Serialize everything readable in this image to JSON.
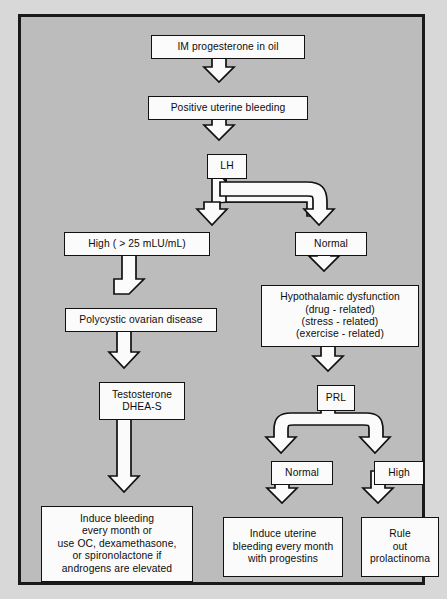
{
  "diagram": {
    "background_color": "#bcbcbc",
    "node_fill_color": "#fbfbfb",
    "line_color": "#111111",
    "frame_border_color": "#1a1a1a"
  },
  "nodes": {
    "im_progesterone": {
      "label": "IM progesterone in oil"
    },
    "positive_bleeding": {
      "label": "Positive uterine bleeding"
    },
    "lh": {
      "label": "LH"
    },
    "high_lh": {
      "label": "High ( > 25 mLU/mL)"
    },
    "normal_lh": {
      "label": "Normal"
    },
    "polycystic": {
      "label": "Polycystic ovarian disease"
    },
    "hypothalamic": {
      "line1": "Hypothalamic dysfunction",
      "line2": "(drug - related)",
      "line3": "(stress - related)",
      "line4": "(exercise - related)"
    },
    "testosterone": {
      "line1": "Testosterone",
      "line2": "DHEA-S"
    },
    "prl": {
      "label": "PRL"
    },
    "normal_prl": {
      "label": "Normal"
    },
    "high_prl": {
      "label": "High"
    },
    "induce_bleeding": {
      "line1": "Induce bleeding",
      "line2": "every month or",
      "line3": "use OC, dexamethasone,",
      "line4": "or spironolactone if",
      "line5": "androgens are elevated"
    },
    "induce_uterine": {
      "line1": "Induce uterine",
      "line2": "bleeding every month",
      "line3": "with progestins"
    },
    "rule_out": {
      "line1": "Rule",
      "line2": "out",
      "line3": "prolactinoma"
    }
  },
  "edges": [
    {
      "from": "im_progesterone",
      "to": "positive_bleeding",
      "type": "block-arrow-down"
    },
    {
      "from": "positive_bleeding",
      "to": "lh",
      "type": "block-arrow-down"
    },
    {
      "from": "lh",
      "to": "high_lh",
      "type": "block-arrow-split-left"
    },
    {
      "from": "lh",
      "to": "normal_lh",
      "type": "block-arrow-split-right"
    },
    {
      "from": "high_lh",
      "to": "polycystic",
      "type": "block-arrow-down"
    },
    {
      "from": "normal_lh",
      "to": "hypothalamic",
      "type": "block-arrow-down"
    },
    {
      "from": "polycystic",
      "to": "testosterone",
      "type": "block-arrow-down"
    },
    {
      "from": "hypothalamic",
      "to": "prl",
      "type": "block-arrow-down"
    },
    {
      "from": "testosterone",
      "to": "induce_bleeding",
      "type": "block-arrow-down"
    },
    {
      "from": "prl",
      "to": "normal_prl",
      "type": "block-arrow-split-left"
    },
    {
      "from": "prl",
      "to": "high_prl",
      "type": "block-arrow-split-right"
    },
    {
      "from": "normal_prl",
      "to": "induce_uterine",
      "type": "block-arrow-down"
    },
    {
      "from": "high_prl",
      "to": "rule_out",
      "type": "block-arrow-down"
    }
  ]
}
